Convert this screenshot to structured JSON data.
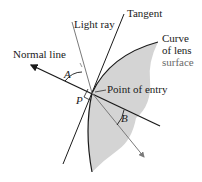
{
  "diagram": {
    "type": "refraction-at-lens-surface",
    "labels": {
      "light_ray": "Light ray",
      "tangent": "Tangent",
      "normal_line": "Normal line",
      "curve_line1": "Curve",
      "curve_line2": "of lens",
      "curve_line3": "surface",
      "point_of_entry": "Point of entry",
      "angle_a": "A",
      "angle_b": "B",
      "point_p": "P"
    },
    "colors": {
      "ray": "#7a7a7a",
      "line": "#1a1a1a",
      "lens_fill": "#d4d4d4"
    }
  }
}
